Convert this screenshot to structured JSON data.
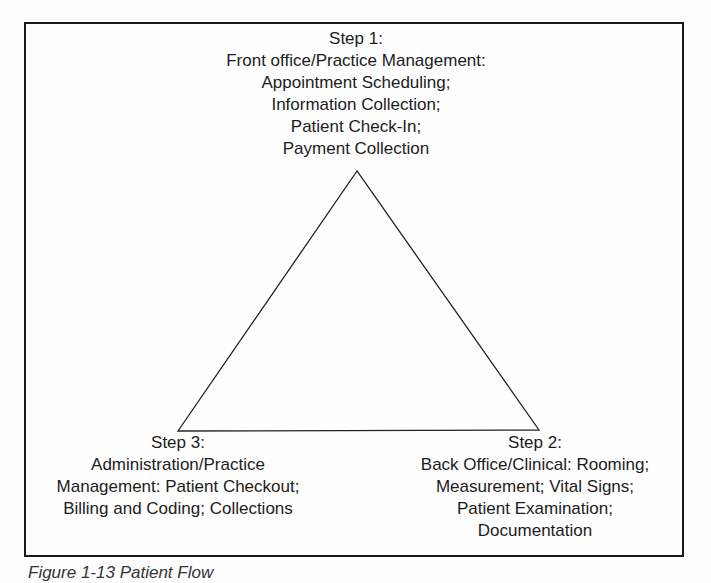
{
  "diagram": {
    "type": "triangle-cycle",
    "step1": {
      "lines": [
        "Step 1:",
        "Front office/Practice Management:",
        "Appointment Scheduling;",
        "Information Collection;",
        "Patient Check-In;",
        "Payment Collection"
      ]
    },
    "step2": {
      "lines": [
        "Step 2:",
        "Back Office/Clinical: Rooming;",
        "Measurement; Vital Signs;",
        "Patient Examination;",
        "Documentation"
      ]
    },
    "step3": {
      "lines": [
        "Step 3:",
        "Administration/Practice",
        "Management: Patient Checkout;",
        "Billing and Coding; Collections"
      ]
    }
  },
  "caption": "Figure 1-13  Patient Flow"
}
